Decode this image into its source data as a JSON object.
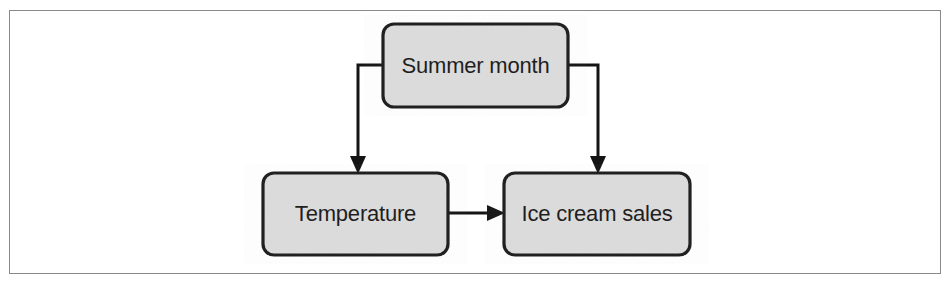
{
  "figure": {
    "type": "causal-diagram",
    "title": "",
    "frame": {
      "visible": true,
      "border_color": "#8a8a8a"
    },
    "style": {
      "node_fill": "#dcdcdc",
      "node_border": "#1c1c1c",
      "connector_color": "#141414",
      "text_color": "#1a1a1a"
    },
    "nodes": [
      {
        "id": "summer-month",
        "label": "Summer month",
        "x": 383,
        "y": 24,
        "width": 185,
        "height": 83
      },
      {
        "id": "temperature",
        "label": "Temperature",
        "x": 263,
        "y": 173,
        "width": 185,
        "height": 82
      },
      {
        "id": "ice-cream-sales",
        "label": "Ice cream sales",
        "x": 504,
        "y": 173,
        "width": 186,
        "height": 82
      }
    ],
    "edges": [
      {
        "id": "summer-month-to-temperature",
        "from": "summer-month",
        "to": "temperature",
        "label": "",
        "route": "left-elbow"
      },
      {
        "id": "summer-month-to-ice-cream-sales",
        "from": "summer-month",
        "to": "ice-cream-sales",
        "label": "",
        "route": "right-elbow"
      },
      {
        "id": "temperature-to-ice-cream-sales",
        "from": "temperature",
        "to": "ice-cream-sales",
        "label": "",
        "route": "straight"
      }
    ]
  }
}
